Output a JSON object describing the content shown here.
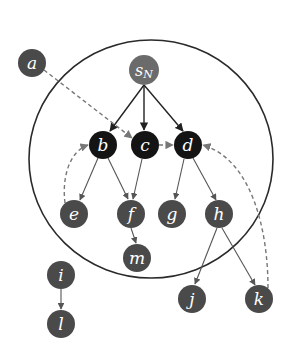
{
  "diagram": {
    "type": "directed-graph",
    "colors": {
      "background": "#ffffff",
      "node_black": "#141414",
      "node_dark": "#4a4a4a",
      "node_source": "#6b6b6b",
      "label": "#ffffff",
      "boundary": "#2a2a2a",
      "edge": "#555555",
      "dashed_edge": "#777777"
    },
    "boundary_circle": {
      "cx": 151,
      "cy": 159,
      "rx": 122,
      "ry": 119
    },
    "nodes": {
      "sn": {
        "label": "s",
        "subscript": "N",
        "x": 144,
        "y": 70,
        "r": 15,
        "style": "source"
      },
      "a": {
        "label": "a",
        "x": 32,
        "y": 63,
        "r": 14,
        "style": "dark"
      },
      "b": {
        "label": "b",
        "x": 103,
        "y": 145,
        "r": 14,
        "style": "black"
      },
      "c": {
        "label": "c",
        "x": 145,
        "y": 145,
        "r": 14,
        "style": "black"
      },
      "d": {
        "label": "d",
        "x": 188,
        "y": 145,
        "r": 14,
        "style": "black"
      },
      "e": {
        "label": "e",
        "x": 74,
        "y": 214,
        "r": 14,
        "style": "dark"
      },
      "f": {
        "label": "f",
        "x": 131,
        "y": 214,
        "r": 14,
        "style": "dark"
      },
      "g": {
        "label": "g",
        "x": 172,
        "y": 214,
        "r": 14,
        "style": "dark"
      },
      "h": {
        "label": "h",
        "x": 219,
        "y": 214,
        "r": 14,
        "style": "dark"
      },
      "m": {
        "label": "m",
        "x": 137,
        "y": 258,
        "r": 14,
        "style": "dark"
      },
      "i": {
        "label": "i",
        "x": 61,
        "y": 275,
        "r": 14,
        "style": "dark"
      },
      "l": {
        "label": "l",
        "x": 61,
        "y": 324,
        "r": 14,
        "style": "dark"
      },
      "j": {
        "label": "j",
        "x": 192,
        "y": 299,
        "r": 14,
        "style": "dark"
      },
      "k": {
        "label": "k",
        "x": 259,
        "y": 299,
        "r": 14,
        "style": "dark"
      }
    },
    "edges": [
      {
        "from": "sn",
        "to": "b",
        "style": "solid"
      },
      {
        "from": "sn",
        "to": "c",
        "style": "solid"
      },
      {
        "from": "sn",
        "to": "d",
        "style": "solid"
      },
      {
        "from": "a",
        "to": "c",
        "style": "dashed"
      },
      {
        "from": "c",
        "to": "d",
        "style": "dashed"
      },
      {
        "from": "e",
        "to": "b",
        "style": "dashed-curved"
      },
      {
        "from": "k",
        "to": "d",
        "style": "dashed-curved"
      },
      {
        "from": "b",
        "to": "e",
        "style": "solid"
      },
      {
        "from": "b",
        "to": "f",
        "style": "solid"
      },
      {
        "from": "c",
        "to": "f",
        "style": "solid"
      },
      {
        "from": "d",
        "to": "g",
        "style": "solid"
      },
      {
        "from": "d",
        "to": "h",
        "style": "solid"
      },
      {
        "from": "f",
        "to": "m",
        "style": "solid"
      },
      {
        "from": "h",
        "to": "j",
        "style": "solid"
      },
      {
        "from": "h",
        "to": "k",
        "style": "solid"
      },
      {
        "from": "i",
        "to": "l",
        "style": "solid"
      }
    ]
  }
}
